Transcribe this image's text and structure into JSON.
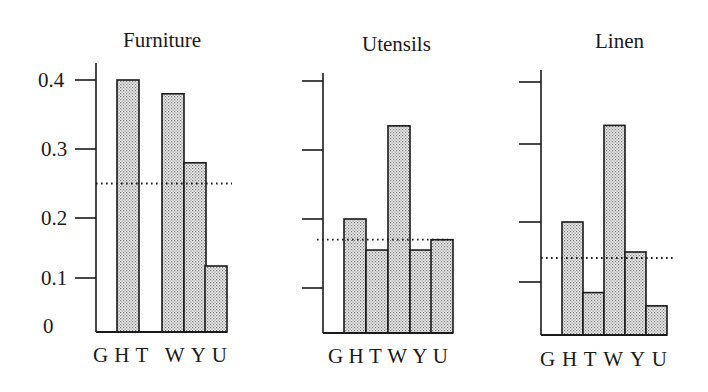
{
  "chart_data": [
    {
      "type": "bar",
      "title": "Furniture",
      "categories": [
        "G",
        "H",
        "T",
        "W",
        "Y",
        "U"
      ],
      "values": [
        0,
        0.4,
        0,
        0.38,
        0.28,
        0.12
      ],
      "reference_line": 0.25,
      "reference_line_style": "dotted",
      "xlabel": "",
      "ylabel": "",
      "yticks": [
        0,
        0.1,
        0.2,
        0.3,
        0.4
      ],
      "ytick_labels": [
        "0",
        "0.1",
        "0.2",
        "0.3",
        "0.4"
      ],
      "ylim": [
        0,
        0.4
      ],
      "grid": false,
      "legend": null
    },
    {
      "type": "bar",
      "title": "Utensils",
      "categories": [
        "G",
        "H",
        "T",
        "W",
        "Y",
        "U"
      ],
      "values": [
        0,
        0.2,
        0.155,
        0.335,
        0.155,
        0.17
      ],
      "reference_line": 0.17,
      "reference_line_style": "dotted",
      "xlabel": "",
      "ylabel": "",
      "yticks": [
        0.1,
        0.2,
        0.3,
        0.4
      ],
      "ytick_labels": [],
      "ylim": [
        0,
        0.4
      ],
      "grid": false,
      "legend": null
    },
    {
      "type": "bar",
      "title": "Linen",
      "categories": [
        "G",
        "H",
        "T",
        "W",
        "Y",
        "U"
      ],
      "values": [
        0,
        0.2,
        0.08,
        0.33,
        0.15,
        0.055
      ],
      "reference_line": 0.14,
      "reference_line_style": "dotted",
      "xlabel": "",
      "ylabel": "",
      "yticks": [
        0.1,
        0.2,
        0.3,
        0.4
      ],
      "ytick_labels": [],
      "ylim": [
        0,
        0.4
      ],
      "grid": false,
      "legend": null
    }
  ],
  "panels": [
    {
      "title": "Furniture",
      "x_labels": "GHT WYU",
      "y_tick_labels": [
        "0.4",
        "0.3",
        "0.2",
        "0.1",
        "0"
      ]
    },
    {
      "title": "Utensils",
      "x_labels": "GHTWYU"
    },
    {
      "title": "Linen",
      "x_labels": "GHTWYU"
    }
  ],
  "style": {
    "bar_fill": "#e4e4e4",
    "bar_dot": "#6a6a6a",
    "line_color": "#1a1a1a"
  }
}
